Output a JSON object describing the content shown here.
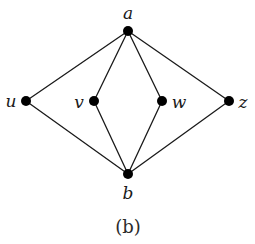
{
  "figure": {
    "caption": "(b)",
    "background_color": "#ffffff",
    "stroke_color": "#1a1a1a",
    "vertex_color": "#000000",
    "vertex_radius": 5,
    "edge_width": 1.3,
    "width": 255,
    "height": 244
  },
  "chart_data": {
    "type": "diagram",
    "diagram_type": "undirected-graph",
    "title": "(b)",
    "vertices": [
      {
        "id": "a",
        "label": "a",
        "x": 128,
        "y": 31,
        "label_x": 128,
        "label_y": 13
      },
      {
        "id": "u",
        "label": "u",
        "x": 26,
        "y": 101,
        "label_x": 11,
        "label_y": 101
      },
      {
        "id": "v",
        "label": "v",
        "x": 94,
        "y": 101,
        "label_x": 79,
        "label_y": 102
      },
      {
        "id": "w",
        "label": "w",
        "x": 162,
        "y": 101,
        "label_x": 179,
        "label_y": 102
      },
      {
        "id": "z",
        "label": "z",
        "x": 229,
        "y": 101,
        "label_x": 243,
        "label_y": 102
      },
      {
        "id": "b",
        "label": "b",
        "x": 128,
        "y": 174,
        "label_x": 128,
        "label_y": 193
      }
    ],
    "edges": [
      {
        "from": "a",
        "to": "u"
      },
      {
        "from": "a",
        "to": "v"
      },
      {
        "from": "a",
        "to": "w"
      },
      {
        "from": "a",
        "to": "z"
      },
      {
        "from": "u",
        "to": "b"
      },
      {
        "from": "v",
        "to": "b"
      },
      {
        "from": "w",
        "to": "b"
      },
      {
        "from": "z",
        "to": "b"
      }
    ],
    "vertex_count": 6,
    "edge_count": 8
  }
}
